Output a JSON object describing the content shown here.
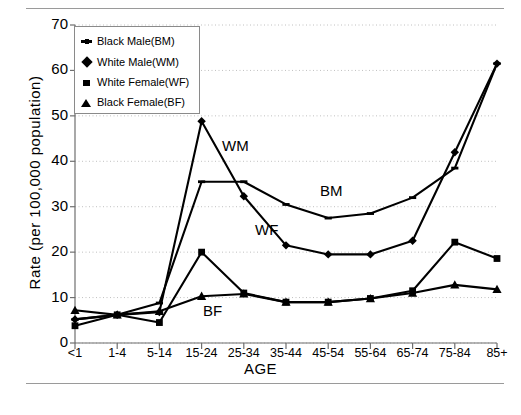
{
  "figure": {
    "rules": [
      "top-rule",
      "bottom-rule"
    ]
  },
  "chart_data": {
    "type": "line",
    "title": "",
    "xlabel": "AGE",
    "ylabel": "Rate (per 100,000 population)",
    "ylim": [
      0,
      70
    ],
    "ytick_values": [
      "0",
      "10",
      "20",
      "30",
      "40",
      "50",
      "60",
      "70"
    ],
    "grid": "horizontal-dotted",
    "legend_position": "top-left-inside",
    "categories": [
      "<1",
      "1-4",
      "5-14",
      "15-24",
      "25-34",
      "35-44",
      "45-54",
      "55-64",
      "65-74",
      "75-84",
      "85+"
    ],
    "series": [
      {
        "name": "Black Male(BM)",
        "short": "BM",
        "marker": "dash-dot",
        "values": [
          5.2,
          6.2,
          8.8,
          35.5,
          35.5,
          30.5,
          27.5,
          28.5,
          32.0,
          38.5,
          61.5
        ]
      },
      {
        "name": "White Male(WM)",
        "short": "WM",
        "marker": "diamond",
        "values": [
          5.2,
          6.2,
          6.8,
          48.8,
          32.3,
          21.5,
          19.5,
          19.5,
          22.5,
          42.0,
          61.5
        ]
      },
      {
        "name": "White Female(WF)",
        "short": "WF",
        "marker": "square",
        "values": [
          3.8,
          6.2,
          4.5,
          20.0,
          11.0,
          9.0,
          9.0,
          9.8,
          11.5,
          22.2,
          18.6
        ]
      },
      {
        "name": "Black Female(BF)",
        "short": "BF",
        "marker": "triangle",
        "values": [
          7.2,
          6.2,
          7.0,
          10.3,
          10.8,
          9.0,
          9.0,
          9.8,
          11.0,
          12.8,
          11.8
        ]
      }
    ],
    "annotations": [
      {
        "text": "WM",
        "x": 222,
        "y": 137
      },
      {
        "text": "BM",
        "x": 320,
        "y": 182
      },
      {
        "text": "WF",
        "x": 255,
        "y": 221
      },
      {
        "text": "BF",
        "x": 203,
        "y": 302
      }
    ],
    "colors": {
      "line": "#000000",
      "grid": "#c0c0c0",
      "axis": "#6f6f6f"
    }
  },
  "legend": {
    "items": [
      {
        "label": "Black Male(BM)",
        "marker": "dash-dot"
      },
      {
        "label": "White Male(WM)",
        "marker": "diamond"
      },
      {
        "label": "White Female(WF)",
        "marker": "square"
      },
      {
        "label": "Black Female(BF)",
        "marker": "triangle"
      }
    ]
  }
}
